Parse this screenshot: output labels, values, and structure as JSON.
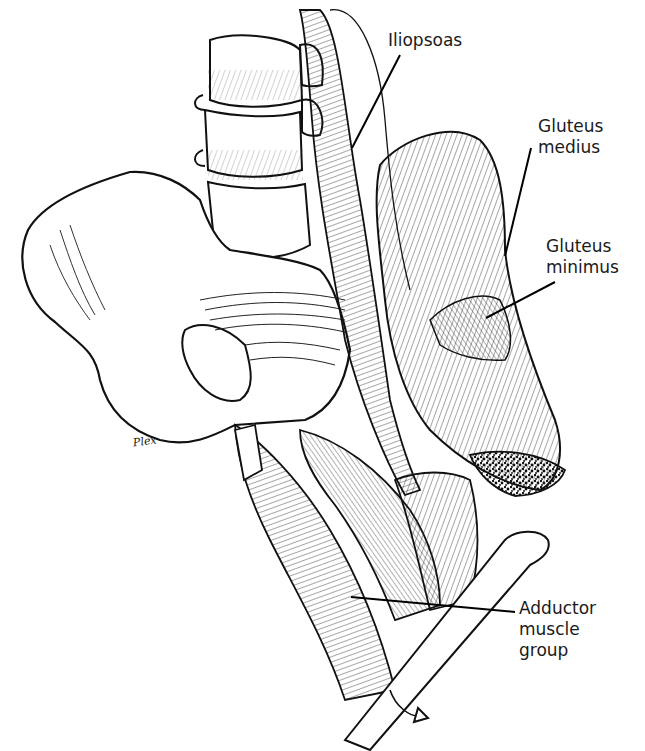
{
  "figure": {
    "artist_signature": "Plex"
  },
  "labels": [
    {
      "id": "iliopsoas",
      "text": "Iliopsoas",
      "x": 388,
      "y": 30
    },
    {
      "id": "gluteus-medius",
      "text": "Gluteus\nmedius",
      "x": 538,
      "y": 116
    },
    {
      "id": "gluteus-minimus",
      "text": "Gluteus\nminimus",
      "x": 546,
      "y": 236
    },
    {
      "id": "adductor-muscle-group",
      "text": "Adductor\nmuscle\ngroup",
      "x": 519,
      "y": 598
    }
  ],
  "leader_lines": [
    {
      "for": "iliopsoas",
      "x1": 400,
      "y1": 55,
      "x2": 352,
      "y2": 148
    },
    {
      "for": "gluteus-medius",
      "x1": 531,
      "y1": 148,
      "x2": 505,
      "y2": 256
    },
    {
      "for": "gluteus-minimus",
      "x1": 555,
      "y1": 282,
      "x2": 486,
      "y2": 318
    },
    {
      "for": "adductor-muscle-group",
      "x1": 351,
      "y1": 597,
      "x2": 515,
      "y2": 612
    }
  ]
}
